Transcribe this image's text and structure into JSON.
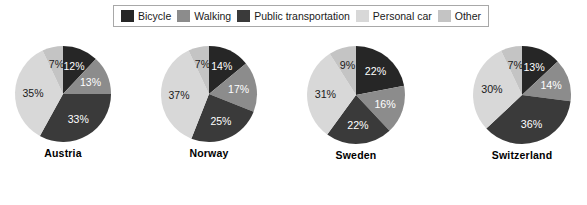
{
  "legend": {
    "entries": [
      {
        "label": "Bicycle",
        "color": "#262626",
        "key": "bicycle"
      },
      {
        "label": "Walking",
        "color": "#8c8c8c",
        "key": "walking"
      },
      {
        "label": "Public transportation",
        "color": "#3a3a3a",
        "key": "public_transportation"
      },
      {
        "label": "Personal car",
        "color": "#d8d8d8",
        "key": "personal_car"
      },
      {
        "label": "Other",
        "color": "#c4c4c4",
        "key": "other"
      }
    ]
  },
  "charts": [
    {
      "country": "Austria"
    },
    {
      "country": "Norway"
    },
    {
      "country": "Sweden"
    },
    {
      "country": "Switzerland"
    }
  ],
  "chart_data": {
    "type": "pie",
    "title": "",
    "subtitle": "",
    "xlabel": "",
    "ylabel": "",
    "grid": false,
    "legend_position": "top",
    "value_unit": "%",
    "start_angle_deg": 0,
    "direction": "clockwise",
    "categories": [
      "Bicycle",
      "Walking",
      "Public transportation",
      "Personal car",
      "Other"
    ],
    "colors": [
      "#262626",
      "#8c8c8c",
      "#3a3a3a",
      "#d8d8d8",
      "#c4c4c4"
    ],
    "label_colors": [
      "#ffffff",
      "#ffffff",
      "#ffffff",
      "#1a1a1a",
      "#1a1a1a"
    ],
    "charts": [
      {
        "name": "Austria",
        "values": [
          12,
          13,
          33,
          35,
          7
        ],
        "labels": [
          "12%",
          "13%",
          "33%",
          "35%",
          "7%"
        ],
        "total": 100
      },
      {
        "name": "Norway",
        "values": [
          14,
          17,
          25,
          37,
          7
        ],
        "labels": [
          "14%",
          "17%",
          "25%",
          "37%",
          "7%"
        ],
        "total": 100
      },
      {
        "name": "Sweden",
        "values": [
          22,
          16,
          22,
          31,
          9
        ],
        "labels": [
          "22%",
          "16%",
          "22%",
          "31%",
          "9%"
        ],
        "total": 100
      },
      {
        "name": "Switzerland",
        "values": [
          13,
          14,
          36,
          30,
          7
        ],
        "labels": [
          "13%",
          "14%",
          "36%",
          "30%",
          "7%"
        ],
        "total": 100
      }
    ]
  }
}
